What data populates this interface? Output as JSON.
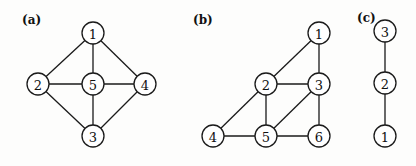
{
  "panels": [
    {
      "label": "(a)",
      "label_pos": [
        22,
        24
      ],
      "nodes": [
        {
          "id": "1",
          "x": 93,
          "y": 33
        },
        {
          "id": "2",
          "x": 38,
          "y": 84
        },
        {
          "id": "5",
          "x": 93,
          "y": 84
        },
        {
          "id": "4",
          "x": 145,
          "y": 84
        },
        {
          "id": "3",
          "x": 93,
          "y": 136
        }
      ],
      "edges": [
        [
          "1",
          "2"
        ],
        [
          "1",
          "5"
        ],
        [
          "1",
          "4"
        ],
        [
          "2",
          "5"
        ],
        [
          "5",
          "4"
        ],
        [
          "2",
          "3"
        ],
        [
          "5",
          "3"
        ],
        [
          "4",
          "3"
        ]
      ]
    },
    {
      "label": "(b)",
      "label_pos": [
        193,
        24
      ],
      "nodes": [
        {
          "id": "1",
          "x": 319,
          "y": 33
        },
        {
          "id": "2",
          "x": 266,
          "y": 84
        },
        {
          "id": "3",
          "x": 319,
          "y": 84
        },
        {
          "id": "4",
          "x": 213,
          "y": 136
        },
        {
          "id": "5",
          "x": 266,
          "y": 136
        },
        {
          "id": "6",
          "x": 319,
          "y": 136
        }
      ],
      "edges": [
        [
          "1",
          "2"
        ],
        [
          "1",
          "3"
        ],
        [
          "2",
          "3"
        ],
        [
          "2",
          "4"
        ],
        [
          "2",
          "5"
        ],
        [
          "3",
          "5"
        ],
        [
          "3",
          "6"
        ],
        [
          "4",
          "5"
        ],
        [
          "5",
          "6"
        ]
      ]
    },
    {
      "label": "(c)",
      "label_pos": [
        357,
        22
      ],
      "nodes": [
        {
          "id": "3",
          "x": 385,
          "y": 31
        },
        {
          "id": "2",
          "x": 385,
          "y": 83
        },
        {
          "id": "1",
          "x": 385,
          "y": 136
        }
      ],
      "edges": [
        [
          "3",
          "2"
        ],
        [
          "2",
          "1"
        ]
      ]
    }
  ],
  "node_radius": 11
}
